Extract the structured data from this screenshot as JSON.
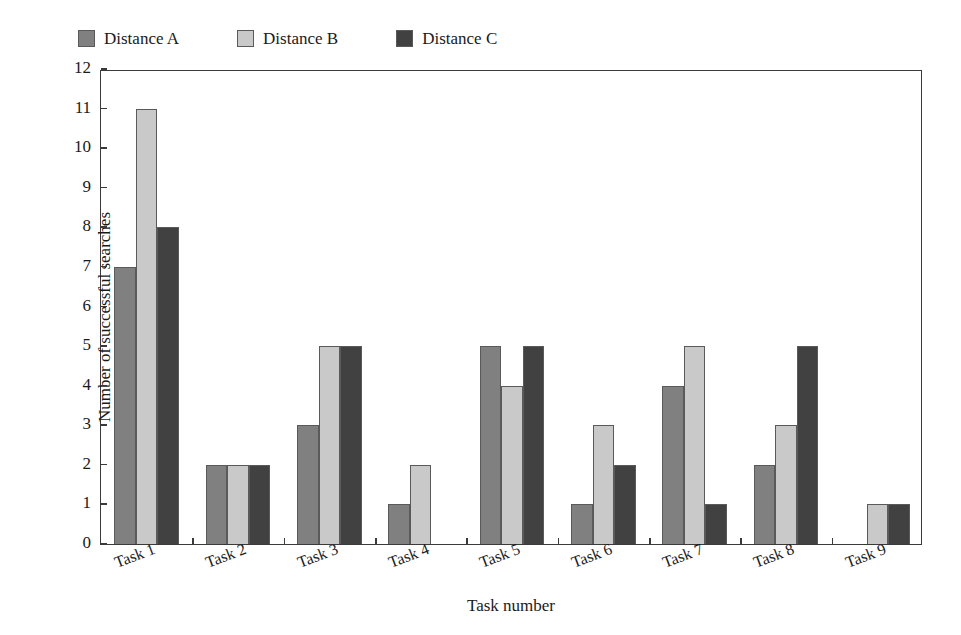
{
  "chart_data": {
    "type": "bar",
    "title": "",
    "xlabel": "Task number",
    "ylabel": "Number of successful searches",
    "categories": [
      "Task 1",
      "Task 2",
      "Task 3",
      "Task 4",
      "Task 5",
      "Task 6",
      "Task 7",
      "Task 8",
      "Task 9"
    ],
    "series": [
      {
        "name": "Distance A",
        "color": "#808080",
        "values": [
          7,
          2,
          3,
          1,
          5,
          1,
          4,
          2,
          0
        ]
      },
      {
        "name": "Distance B",
        "color": "#c9c9c9",
        "values": [
          11,
          2,
          5,
          2,
          4,
          3,
          5,
          3,
          1
        ]
      },
      {
        "name": "Distance C",
        "color": "#414141",
        "values": [
          8,
          2,
          5,
          0,
          5,
          2,
          1,
          5,
          1
        ]
      }
    ],
    "ylim": [
      0,
      12
    ],
    "ytick_step": 1,
    "yticks": [
      0,
      1,
      2,
      3,
      4,
      5,
      6,
      7,
      8,
      9,
      10,
      11,
      12
    ],
    "ytick_labels": [
      "0",
      "1",
      "2",
      "3",
      "4",
      "5",
      "6",
      "7",
      "8",
      "9",
      "10",
      "11",
      "12"
    ],
    "grid": false,
    "legend_position": "top-left",
    "bar_border_color": "#5a5a5a",
    "axis_color": "#3a3a3a",
    "background": "#ffffff"
  }
}
